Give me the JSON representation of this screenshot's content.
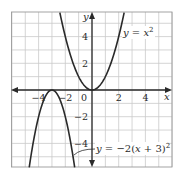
{
  "chart_data": {
    "type": "line",
    "title": "",
    "xlabel": "x",
    "ylabel": "y",
    "xlim": [
      -6,
      6
    ],
    "ylim": [
      -5.8,
      5.8
    ],
    "grid": true,
    "grid_step": 1,
    "x_ticks": [
      -4,
      -2,
      0,
      2,
      4
    ],
    "y_ticks": [
      -4,
      -2,
      2,
      4
    ],
    "x_tick_labels": [
      "−4",
      "−2",
      "0",
      "2",
      "4"
    ],
    "y_tick_labels": [
      "−4",
      "−2",
      "2",
      "4"
    ],
    "series": [
      {
        "name": "y = x^2",
        "label": "y = x²",
        "expression": "x^2",
        "vertex": [
          0,
          0
        ],
        "color": "#2a2a2a",
        "x": [
          -2.4,
          -2,
          -1,
          0,
          1,
          2,
          2.4
        ],
        "y": [
          5.76,
          4,
          1,
          0,
          1,
          4,
          5.76
        ]
      },
      {
        "name": "y = -2(x + 3)^2",
        "label": "y = −2(x + 3)²",
        "expression": "-2(x+3)^2",
        "vertex": [
          -3,
          0
        ],
        "color": "#2a2a2a",
        "x": [
          -4.7,
          -4,
          -3.5,
          -3,
          -2.5,
          -2,
          -1.3
        ],
        "y": [
          -5.78,
          -2,
          -0.5,
          0,
          -0.5,
          -2,
          -5.78
        ]
      }
    ]
  },
  "labels": {
    "x_axis": "x",
    "y_axis": "y",
    "eq1_prefix": "y",
    "eq1_mid": " = ",
    "eq1_var": "x",
    "eq1_sup": "2",
    "eq2_prefix": "y",
    "eq2_mid": " = −2(",
    "eq2_var": "x",
    "eq2_tail": " + 3)",
    "eq2_sup": "2"
  },
  "colors": {
    "grid": "#c9c9c9",
    "axis": "#2a2a2a",
    "curve": "#2a2a2a",
    "background": "#ffffff"
  }
}
